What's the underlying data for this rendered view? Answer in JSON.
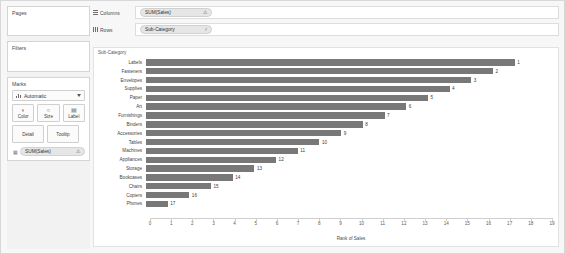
{
  "left_panel": {
    "pages": {
      "title": "Pages"
    },
    "filters": {
      "title": "Filters"
    },
    "marks": {
      "title": "Marks",
      "type_label": "Automatic",
      "type_icon": "bar-chart-icon",
      "buttons": [
        {
          "label": "Color",
          "icon": "color-palette-icon",
          "glyph": "◐"
        },
        {
          "label": "Size",
          "icon": "size-icon",
          "glyph": "○"
        },
        {
          "label": "Label",
          "icon": "label-icon",
          "glyph": "▤"
        },
        {
          "label": "Detail",
          "icon": "detail-icon",
          "glyph": ""
        },
        {
          "label": "Tooltip",
          "icon": "tooltip-icon",
          "glyph": ""
        }
      ],
      "pill": {
        "label": "SUM(Sales)",
        "icon": "label-text-icon",
        "warning": "⚠"
      }
    }
  },
  "shelves": [
    {
      "name": "columns",
      "label": "Columns",
      "icon": "columns-grid-icon",
      "pill": {
        "label": "SUM(Sales)",
        "warning": "⚠"
      }
    },
    {
      "name": "rows",
      "label": "Rows",
      "icon": "rows-grid-icon",
      "pill": {
        "label": "Sub-Category",
        "warning": "⫽"
      }
    }
  ],
  "viz": {
    "row_header": "Sub-Category",
    "bar_color": "#787878"
  },
  "chart_data": {
    "type": "bar",
    "orientation": "horizontal",
    "title": "",
    "xlabel": "Rank of Sales",
    "ylabel": "Sub-Category",
    "xlim": [
      0,
      19
    ],
    "xticks": [
      0,
      1,
      2,
      3,
      4,
      5,
      6,
      7,
      8,
      9,
      10,
      11,
      12,
      13,
      14,
      15,
      16,
      17,
      18,
      19
    ],
    "grid": false,
    "legend": false,
    "categories": [
      "Labels",
      "Fasteners",
      "Envelopes",
      "Supplies",
      "Paper",
      "Art",
      "Furnishings",
      "Binders",
      "Accessories",
      "Tables",
      "Machines",
      "Appliances",
      "Storage",
      "Bookcases",
      "Chairs",
      "Copiers",
      "Phones"
    ],
    "values": [
      17,
      16,
      15,
      14,
      13,
      12,
      11,
      10,
      9,
      8,
      7,
      6,
      5,
      4,
      3,
      2,
      1
    ],
    "labels": [
      "1",
      "2",
      "3",
      "4",
      "5",
      "6",
      "7",
      "8",
      "9",
      "10",
      "11",
      "12",
      "13",
      "14",
      "15",
      "16",
      "17"
    ]
  }
}
